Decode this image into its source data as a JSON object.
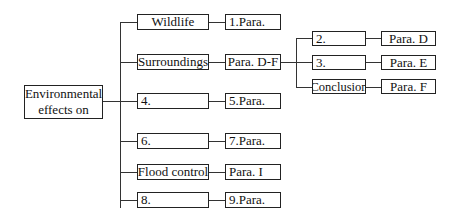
{
  "diagram": {
    "root": {
      "line1": "Environmental",
      "line2": "effects on"
    },
    "branches": [
      {
        "topic": "Wildlife",
        "para": "1.Para."
      },
      {
        "topic": "Surroundings",
        "para": "Para. D-F"
      },
      {
        "topic": "4.",
        "para": "5.Para."
      },
      {
        "topic": "6.",
        "para": "7.Para."
      },
      {
        "topic": "Flood control",
        "para": "Para. I"
      },
      {
        "topic": "8.",
        "para": "9.Para."
      }
    ],
    "sub_branches": [
      {
        "topic": "2.",
        "para": "Para. D"
      },
      {
        "topic": "3.",
        "para": "Para. E"
      },
      {
        "topic": "Conclusion",
        "para": "Para. F"
      }
    ]
  }
}
